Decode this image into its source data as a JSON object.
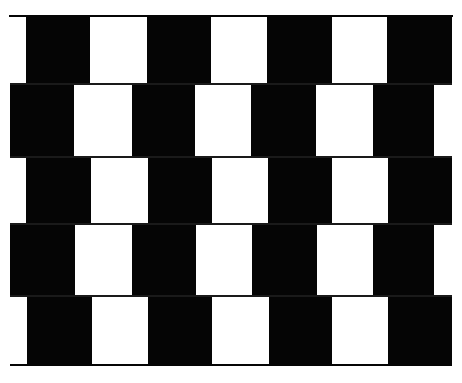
{
  "colors": {
    "background": "#ffffff",
    "dark": "#050505",
    "light": "#ffffff",
    "mortar": "#1a1a1a"
  },
  "figure": {
    "border_top": {
      "x1": 9,
      "x2": 453,
      "y": 15,
      "thickness": 2
    },
    "border_bottom": {
      "x1": 10,
      "x2": 452,
      "y": 364,
      "thickness": 2
    },
    "rows": [
      {
        "y": 16,
        "h": 68,
        "dark": [
          [
            26,
            90
          ],
          [
            147,
            211
          ],
          [
            267,
            332
          ],
          [
            387,
            452
          ]
        ],
        "light": [
          [
            90,
            147
          ],
          [
            211,
            267
          ],
          [
            332,
            387
          ]
        ]
      },
      {
        "y": 84,
        "h": 73,
        "dark": [
          [
            10,
            74
          ],
          [
            132,
            195
          ],
          [
            251,
            316
          ],
          [
            373,
            434
          ]
        ],
        "light": [
          [
            74,
            132
          ],
          [
            195,
            251
          ],
          [
            316,
            373
          ],
          [
            434,
            462
          ]
        ]
      },
      {
        "y": 157,
        "h": 67,
        "dark": [
          [
            26,
            91
          ],
          [
            148,
            212
          ],
          [
            268,
            332
          ],
          [
            388,
            452
          ]
        ],
        "light": [
          [
            91,
            148
          ],
          [
            212,
            268
          ],
          [
            332,
            388
          ]
        ]
      },
      {
        "y": 224,
        "h": 72,
        "dark": [
          [
            10,
            75
          ],
          [
            132,
            196
          ],
          [
            252,
            317
          ],
          [
            373,
            434
          ]
        ],
        "light": [
          [
            75,
            132
          ],
          [
            196,
            252
          ],
          [
            317,
            373
          ],
          [
            434,
            462
          ]
        ]
      },
      {
        "y": 296,
        "h": 68,
        "dark": [
          [
            27,
            92
          ],
          [
            148,
            212
          ],
          [
            269,
            332
          ],
          [
            388,
            452
          ]
        ],
        "light": [
          [
            92,
            148
          ],
          [
            212,
            269
          ],
          [
            332,
            388
          ]
        ]
      }
    ],
    "mortar_lines_y": [
      84,
      157,
      224,
      296
    ]
  }
}
